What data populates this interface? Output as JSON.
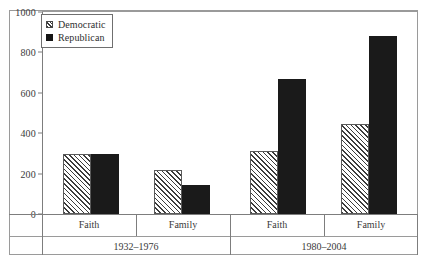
{
  "chart_data": {
    "type": "bar",
    "title": "",
    "xlabel": "",
    "ylabel": "",
    "ylim": [
      0,
      1000
    ],
    "ytick_step": 200,
    "yticks": [
      "0",
      "200",
      "400",
      "600",
      "800",
      "1000"
    ],
    "grid": false,
    "legend_position": "top-left",
    "categories": [
      "Faith",
      "Family",
      "Faith",
      "Family"
    ],
    "groups": [
      {
        "label": "1932–1976",
        "categories": [
          "Faith",
          "Family"
        ]
      },
      {
        "label": "1980–2004",
        "categories": [
          "Faith",
          "Family"
        ]
      }
    ],
    "series": [
      {
        "name": "Democratic",
        "fill": "diagonal-hatch",
        "color": "#e8e8e8",
        "values": [
          295,
          218,
          310,
          445
        ]
      },
      {
        "name": "Republican",
        "fill": "solid",
        "color": "#1a1a1a",
        "values": [
          298,
          146,
          670,
          880
        ]
      }
    ]
  },
  "legend": {
    "items": [
      {
        "label": "Democratic",
        "swatch": "hatched-swatch"
      },
      {
        "label": "Republican",
        "swatch": "solid-black-swatch"
      }
    ]
  },
  "axes": {
    "y_ticks": [
      "1000",
      "800",
      "600",
      "400",
      "200",
      "0"
    ],
    "category_labels": [
      "Faith",
      "Family",
      "Faith",
      "Family"
    ],
    "period_labels": [
      "1932–1976",
      "1980–2004"
    ]
  }
}
